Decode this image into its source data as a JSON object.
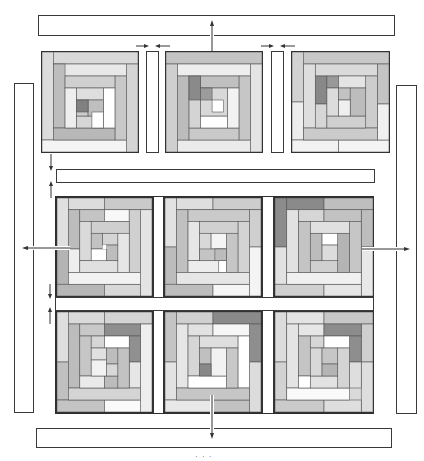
{
  "diagram": {
    "type": "quilt-assembly",
    "colors": {
      "outline": "#333333",
      "white": "#ffffff",
      "pale": "#e6e6e6",
      "light": "#d2d2d2",
      "medium": "#b9b9b9",
      "dark": "#9a9a9a",
      "darkest": "#7a7a7a"
    },
    "grid": {
      "rows": 3,
      "cols": 3
    },
    "blocks": [
      {
        "id": "r1c1",
        "accent": "darkest-center"
      },
      {
        "id": "r1c2",
        "accent": "darkest-center"
      },
      {
        "id": "r1c3",
        "accent": "darkest-center"
      },
      {
        "id": "r2c1",
        "accent": "none"
      },
      {
        "id": "r2c2",
        "accent": "none"
      },
      {
        "id": "r2c3",
        "accent": "dark-corner"
      },
      {
        "id": "r3c1",
        "accent": "dark-top-right"
      },
      {
        "id": "r3c2",
        "accent": "dark-top-right"
      },
      {
        "id": "r3c3",
        "accent": "dark-top-right"
      }
    ],
    "strips": {
      "top_border": "top border strip",
      "bottom_border": "bottom border strip",
      "left_border": "left border strip",
      "right_border": "right border strip",
      "horizontal_sashing": "horizontal sashing strip",
      "vertical_sashing": "vertical sashing strips"
    },
    "arrows": [
      "up",
      "down",
      "left",
      "right",
      "inward-pair",
      "inward-pair",
      "vertical-pair",
      "vertical-pair"
    ],
    "caption": "· · ·"
  }
}
